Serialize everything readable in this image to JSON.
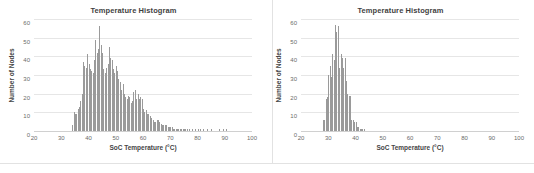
{
  "page": {
    "background_color": "#ffffff",
    "divider_color": "#e2e2e2"
  },
  "charts": [
    {
      "panel_name": "left-histogram-panel",
      "title": "Temperature Histogram",
      "xlabel": "SoC Temperature (°C)",
      "ylabel": "Number of Nodes"
    },
    {
      "panel_name": "right-histogram-panel",
      "title": "Temperature Histogram",
      "xlabel": "SoC Temperature (°C)",
      "ylabel": "Number of Nodes"
    }
  ],
  "chart_data": [
    {
      "type": "bar",
      "id": "left-temperature-histogram",
      "title": "Temperature Histogram",
      "xlabel": "SoC Temperature (°C)",
      "ylabel": "Number of Nodes",
      "xlim": [
        20,
        100
      ],
      "ylim": [
        0,
        60
      ],
      "xticks": [
        20,
        30,
        40,
        50,
        60,
        70,
        80,
        90,
        100
      ],
      "yticks": [
        0,
        10,
        20,
        30,
        40,
        50,
        60
      ],
      "grid": "horizontal",
      "legend": "none",
      "bar_color": "#9a9a9a",
      "bin_width": 0.5,
      "x": [
        34.0,
        34.5,
        35.0,
        35.5,
        36.0,
        36.5,
        37.0,
        37.5,
        38.0,
        38.5,
        39.0,
        39.5,
        40.0,
        40.5,
        41.0,
        41.5,
        42.0,
        42.5,
        43.0,
        43.5,
        44.0,
        44.5,
        45.0,
        45.5,
        46.0,
        46.5,
        47.0,
        47.5,
        48.0,
        48.5,
        49.0,
        49.5,
        50.0,
        50.5,
        51.0,
        51.5,
        52.0,
        52.5,
        53.0,
        53.5,
        54.0,
        54.5,
        55.0,
        55.5,
        56.0,
        56.5,
        57.0,
        57.5,
        58.0,
        58.5,
        59.0,
        59.5,
        60.0,
        60.5,
        61.0,
        61.5,
        62.0,
        62.5,
        63.0,
        63.5,
        64.0,
        64.5,
        65.0,
        65.5,
        66.0,
        66.5,
        67.0,
        67.5,
        68.0,
        68.5,
        69.0,
        69.5,
        70.0,
        70.5,
        71.0,
        71.5,
        72.0,
        72.5,
        73.0,
        73.5,
        74.0,
        74.5,
        75.0,
        75.5,
        76.0,
        77.0,
        78.0,
        79.0,
        80.0,
        81.0,
        82.0,
        83.5,
        85.0,
        88.0,
        89.5,
        90.5
      ],
      "values": [
        3,
        10,
        9,
        9,
        12,
        13,
        16,
        20,
        37,
        35,
        34,
        41,
        36,
        33,
        32,
        31,
        38,
        49,
        42,
        44,
        56,
        46,
        42,
        33,
        31,
        34,
        36,
        45,
        39,
        38,
        33,
        31,
        35,
        32,
        28,
        26,
        22,
        25,
        20,
        18,
        17,
        19,
        18,
        15,
        16,
        21,
        22,
        17,
        20,
        17,
        18,
        17,
        12,
        10,
        11,
        9,
        9,
        8,
        7,
        6,
        5,
        5,
        6,
        6,
        5,
        4,
        3,
        3,
        3,
        3,
        2,
        2,
        2,
        2,
        1,
        1,
        1,
        1,
        1,
        1,
        1,
        1,
        1,
        1,
        1,
        1,
        1,
        1,
        1,
        1,
        1,
        1,
        1,
        1,
        1,
        1
      ]
    },
    {
      "type": "bar",
      "id": "right-temperature-histogram",
      "title": "Temperature Histogram",
      "xlabel": "SoC Temperature (°C)",
      "ylabel": "Number of Nodes",
      "xlim": [
        20,
        100
      ],
      "ylim": [
        0,
        60
      ],
      "xticks": [
        20,
        30,
        40,
        50,
        60,
        70,
        80,
        90,
        100
      ],
      "yticks": [
        0,
        10,
        20,
        30,
        40,
        50,
        60
      ],
      "grid": "horizontal",
      "legend": "none",
      "bar_color": "#9a9a9a",
      "bin_width": 0.5,
      "x": [
        28.0,
        28.5,
        29.0,
        29.5,
        30.0,
        30.5,
        31.0,
        31.5,
        32.0,
        32.5,
        33.0,
        33.5,
        34.0,
        34.5,
        35.0,
        35.5,
        36.0,
        36.5,
        37.0,
        37.5,
        38.0,
        38.5,
        39.0,
        39.5,
        40.0,
        40.5,
        41.0,
        41.5,
        42.0,
        42.5,
        43.0
      ],
      "values": [
        6,
        6,
        17,
        18,
        30,
        35,
        29,
        41,
        38,
        57,
        53,
        56,
        34,
        41,
        39,
        34,
        39,
        27,
        20,
        19,
        19,
        6,
        6,
        5,
        5,
        2,
        2,
        1,
        1,
        1,
        1
      ]
    }
  ]
}
